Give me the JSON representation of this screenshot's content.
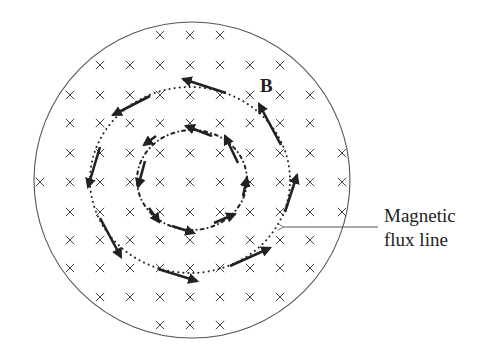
{
  "diagram": {
    "colors": {
      "background": "#ffffff",
      "ink": "#222222",
      "cross": "#444444",
      "outline": "#555555"
    },
    "field_symbol": "×",
    "field_direction": "into page",
    "region": {
      "shape": "circle",
      "cx": 192,
      "cy": 180,
      "r": 158
    },
    "grid": {
      "columns_x": [
        40,
        70,
        100,
        130,
        160,
        190,
        220,
        250,
        280,
        310,
        342
      ],
      "rows_y": [
        35,
        65,
        95,
        123,
        153,
        182,
        212,
        240,
        268,
        297,
        325
      ]
    },
    "flux_loops": [
      {
        "name": "outer",
        "cx": 190,
        "cy": 180,
        "rx": 100,
        "ry": 93,
        "style": "dotted",
        "arrow_count": 8,
        "direction": "counterclockwise"
      },
      {
        "name": "inner",
        "cx": 192,
        "cy": 180,
        "rx": 55,
        "ry": 50,
        "style": "dash-dot",
        "arrow_count": 8,
        "direction": "counterclockwise"
      }
    ],
    "labels": {
      "b_vector": "B",
      "flux_line_line1": "Magnetic",
      "flux_line_line2": "flux line"
    },
    "pointer": {
      "from": [
        378,
        227
      ],
      "to": [
        283,
        227
      ]
    }
  }
}
